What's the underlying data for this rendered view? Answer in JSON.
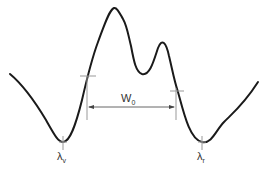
{
  "diagram": {
    "type": "spectral line profile (double-peaked)",
    "colors": {
      "curve": "#1a1a1a",
      "guides": "#999999",
      "text": "#333333"
    },
    "labels": {
      "width": {
        "main": "W",
        "sub": "0"
      },
      "left_min": {
        "main": "λ",
        "sub": "v"
      },
      "right_min": {
        "main": "λ",
        "sub": "r"
      }
    }
  }
}
